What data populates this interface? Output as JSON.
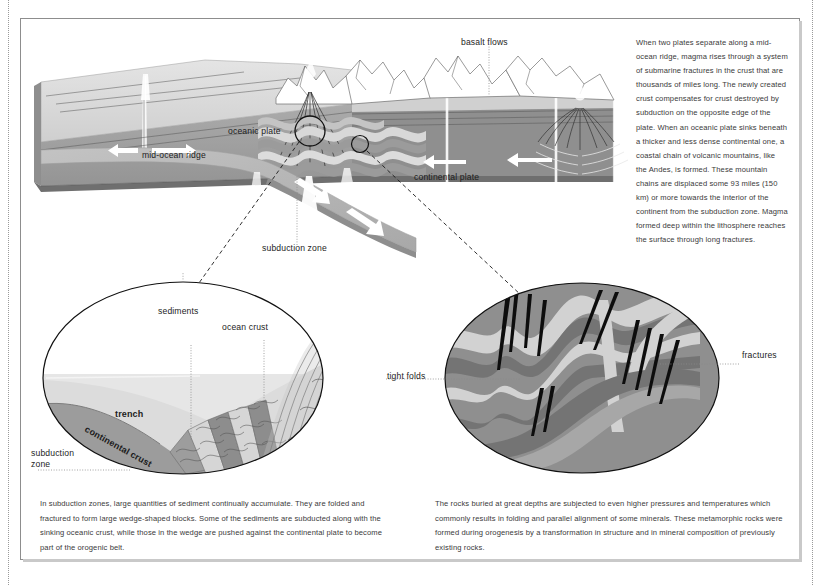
{
  "figure": {
    "title_alt": "Plate tectonics: sea-floor spreading, subduction and orogenesis",
    "side_text": "When two plates separate along a mid-ocean ridge, magma rises through a system of submarine fractures in the crust that are thousands of miles long. The newly created crust compensates for crust destroyed by subduction on the opposite edge of the plate. When an oceanic plate sinks beneath a thicker and less dense continental one, a coastal chain of volcanic mountains, like the Andes, is formed. These mountain chains are displaced some 93 miles (150 km) or more towards the interior of the continent from the subduction zone. Magma formed deep within the lithosphere reaches the surface through long fractures.",
    "caption_left": "In subduction zones, large quantities of sediment continually accumulate. They are folded and fractured to form large wedge-shaped blocks. Some of the sediments are subducted along with the sinking oceanic crust, while those in the wedge are pushed against the continental plate to become part of the orogenic belt.",
    "caption_right": "The rocks buried at great depths are subjected to even higher pressures and temperatures which commonly results in folding and parallel alignment of some minerals.  These metamorphic rocks were formed during orogenesis by a transformation in structure and in mineral composition of previously existing rocks."
  },
  "block_diagram": {
    "labels": {
      "basalt_flows": "basalt flows",
      "oceanic_plate": "oceanic plate",
      "mid_ocean_ridge": "mid-ocean ridge",
      "continental_plate": "continental plate",
      "subduction_zone": "subduction zone"
    }
  },
  "detail_left": {
    "labels": {
      "sediments": "sediments",
      "ocean_crust": "ocean crust",
      "trench": "trench",
      "continental_crust": "continental crust",
      "subduction_zone": "subduction zone"
    }
  },
  "detail_right": {
    "labels": {
      "tight_folds": "tight folds",
      "fractures": "fractures"
    }
  },
  "colors": {
    "page_background": "#ffffff",
    "frame_border": "#8d8d8d",
    "frame_shadow": "#c9c9c9",
    "crust_top_light": "#dcdcdc",
    "crust_front_mid": "#a3a3a3",
    "mantle_dark": "#7e7e7e",
    "slab_gray": "#b6b6b6",
    "sea_light": "#e9e9e9",
    "fold_dark": "#8a8a8a",
    "fold_light": "#d3d3d3",
    "fracture_black": "#101010",
    "arrow_white": "#ffffff",
    "text": "#3a3a3a",
    "leader_dotted": "#8b8b8b"
  }
}
